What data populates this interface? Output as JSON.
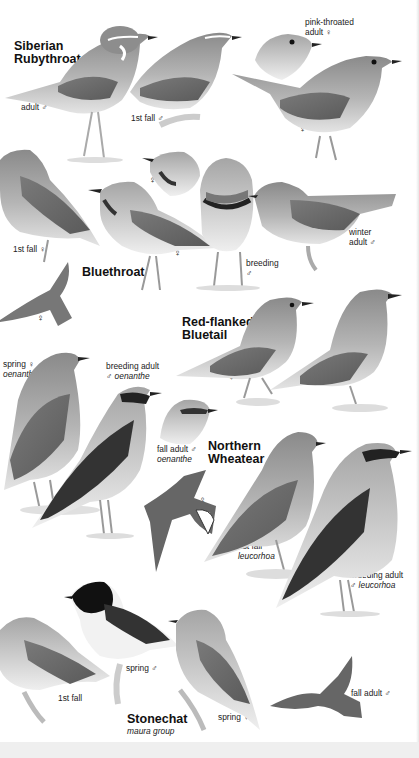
{
  "plate": {
    "background": "#ffffff",
    "footer_band_color": "#efefef",
    "species": [
      {
        "name_line1": "Siberian",
        "name_line2": "Rubythroat",
        "labels": [
          {
            "text": "adult ♂"
          },
          {
            "text": "1st fall ♂"
          },
          {
            "line1": "pink-throated",
            "line2": "adult ♀"
          },
          {
            "text": "♀"
          }
        ]
      },
      {
        "name_line1": "Bluethroat",
        "labels": [
          {
            "text": "1st fall ♀"
          },
          {
            "text": "♀"
          },
          {
            "text": "♀ (flight)"
          },
          {
            "text": "♀ (head)"
          },
          {
            "line1": "breeding",
            "line2": "♂"
          },
          {
            "line1": "winter",
            "line2": "adult ♂"
          }
        ]
      },
      {
        "name_line1": "Red-flanked",
        "name_line2": "Bluetail",
        "labels": [
          {
            "text": "♀"
          },
          {
            "text": "adult ♂"
          }
        ]
      },
      {
        "name_line1": "Northern",
        "name_line2": "Wheatear",
        "labels": [
          {
            "line1": "spring ♀",
            "line2": "oenanthe"
          },
          {
            "line1": "breeding adult",
            "line2": "♂ oenanthe"
          },
          {
            "line1": "fall adult ♂",
            "line2": "oenanthe"
          },
          {
            "text": "♀"
          },
          {
            "line1": "1st fall",
            "line2": "leucorhoa"
          },
          {
            "line1": "breeding adult",
            "line2": "♂ leucorhoa"
          }
        ]
      },
      {
        "name_line1": "Stonechat",
        "subtitle": "maura group",
        "labels": [
          {
            "text": "1st fall"
          },
          {
            "text": "spring ♂"
          },
          {
            "text": "spring ♀"
          },
          {
            "text": "fall adult ♂"
          }
        ]
      }
    ]
  }
}
